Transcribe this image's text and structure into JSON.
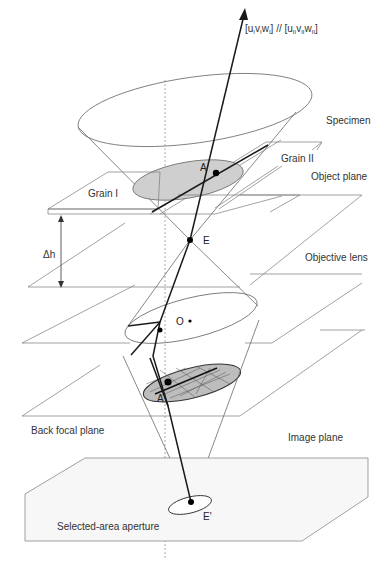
{
  "diagram": {
    "title_direction": {
      "text": "[u",
      "full": "[uIvIwI] // [uIIvIIwII]",
      "part1_open": "[u",
      "part1_sub1": "I",
      "part1_v": "v",
      "part1_sub2": "I",
      "part1_w": "w",
      "part1_sub3": "I",
      "part1_close": "]",
      "sep": " // ",
      "part2_open": "[u",
      "part2_sub1": "II",
      "part2_v": "v",
      "part2_sub2": "II",
      "part2_w": "w",
      "part2_sub3": "II",
      "part2_close": "]"
    },
    "labels": {
      "specimen": "Specimen",
      "grain_ii": "Grain II",
      "grain_i": "Grain I",
      "object_plane": "Object plane",
      "delta_h": "Δh",
      "objective_lens": "Objective lens",
      "back_focal_plane": "Back focal plane",
      "image_plane": "Image plane",
      "selected_area_aperture": "Selected-area aperture"
    },
    "points": {
      "A": "A",
      "E": "E",
      "O": "O",
      "A_prime": "A'",
      "E_prime": "E'"
    },
    "colors": {
      "line": "#1a1a1a",
      "thin_line": "#7a7a7a",
      "ellipse_fill": "#cfcfcf",
      "aperture_fill": "#f7f7f7"
    }
  }
}
